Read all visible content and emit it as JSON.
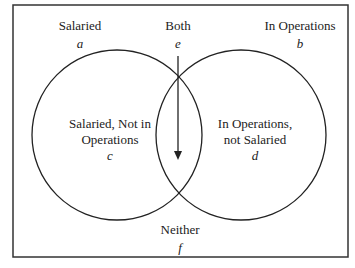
{
  "diagram": {
    "type": "venn",
    "sets": [
      "Salaried",
      "In Operations"
    ],
    "labels": {
      "salaried": {
        "title": "Salaried",
        "var": "a"
      },
      "both": {
        "title": "Both",
        "var": "e"
      },
      "in_operations": {
        "title": "In Operations",
        "var": "b"
      },
      "left_only": {
        "line1": "Salaried, Not in",
        "line2": "Operations",
        "var": "c"
      },
      "right_only": {
        "line1": "In Operations,",
        "line2": "not Salaried",
        "var": "d"
      },
      "neither": {
        "title": "Neither",
        "var": "f"
      }
    },
    "colors": {
      "stroke": "#222222",
      "background": "#ffffff"
    }
  }
}
